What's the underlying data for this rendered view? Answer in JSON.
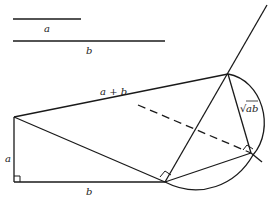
{
  "labels": {
    "segment_a": "a",
    "segment_b": "b",
    "hypotenuse": "a + b",
    "left_leg": "a",
    "bottom_leg": "b",
    "sqrt_prefix": "√",
    "sqrt_body": "ab"
  },
  "colors": {
    "stroke": "#1a1a1a",
    "background": "#ffffff"
  }
}
